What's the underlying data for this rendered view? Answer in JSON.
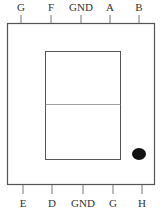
{
  "diagram": {
    "type": "pin-diagram",
    "top_pins": [
      {
        "label": "G",
        "x": 21
      },
      {
        "label": "F",
        "x": 51
      },
      {
        "label": "GND",
        "x": 81
      },
      {
        "label": "A",
        "x": 110
      },
      {
        "label": "B",
        "x": 139
      }
    ],
    "bottom_pins": [
      {
        "label": "E",
        "x": 23
      },
      {
        "label": "D",
        "x": 52
      },
      {
        "label": "GND",
        "x": 83
      },
      {
        "label": "G",
        "x": 113
      },
      {
        "label": "H",
        "x": 142
      }
    ],
    "colors": {
      "stroke": "#555555",
      "text": "#333333",
      "dot": "#111111",
      "background": "#ffffff"
    }
  }
}
